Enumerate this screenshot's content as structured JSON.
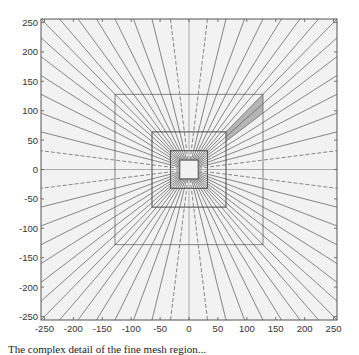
{
  "figure": {
    "caption": "The complex detail of the fine mesh region...",
    "plot_area": {
      "background": "#f2f2f2",
      "frame_color": "#555555"
    },
    "colors": {
      "ray": "#6a6a6a",
      "box": "#555555",
      "axis": "#9a9a9a",
      "shade": "#b5b5b5"
    }
  },
  "chart_data": {
    "type": "diagram",
    "title": "",
    "xlabel": "",
    "ylabel": "",
    "xlim": [
      -256,
      256
    ],
    "ylim": [
      -256,
      256
    ],
    "x_ticks": [
      -250,
      -200,
      -150,
      -100,
      -50,
      0,
      50,
      100,
      150,
      200,
      250
    ],
    "y_ticks": [
      250,
      200,
      150,
      100,
      50,
      0,
      -50,
      -100,
      -150,
      -200,
      -250
    ],
    "nested_squares_half_width": [
      16,
      32,
      64,
      128,
      256
    ],
    "ray_boundary_spacing": 32,
    "rays_start_at_half_width": 16,
    "dashed_rays_at_boundary_offset": 32,
    "shaded_region": [
      [
        64,
        64
      ],
      [
        128,
        128
      ],
      [
        128,
        96
      ],
      [
        64,
        48
      ]
    ],
    "axis_lines": {
      "x0": true,
      "y0": true
    },
    "grid": false
  }
}
